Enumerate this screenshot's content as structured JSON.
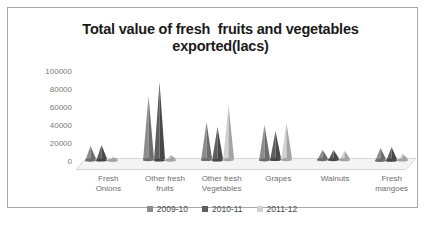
{
  "chart_data": {
    "type": "bar",
    "title": "Total value of fresh  fruits and vegetables exported(lacs)",
    "xlabel": "",
    "ylabel": "",
    "ylim": [
      0,
      100000
    ],
    "yticks": [
      "0",
      "20000",
      "40000",
      "60000",
      "80000",
      "100000"
    ],
    "ytick_values": [
      0,
      20000,
      40000,
      60000,
      80000,
      100000
    ],
    "grid": false,
    "legend_position": "bottom",
    "categories": [
      "Fresh\nOnions",
      "Other fresh\nfruits",
      "Other fresh\nVegetables",
      "Grapes",
      "Walnuts",
      "Fresh\nmangoes"
    ],
    "series": [
      {
        "name": "2009-10",
        "color": "#8c8c8c",
        "values": [
          17000,
          72000,
          43000,
          40000,
          12000,
          15000
        ]
      },
      {
        "name": "2010-11",
        "color": "#5e5e5e",
        "values": [
          18000,
          88000,
          38000,
          33000,
          12000,
          16000
        ]
      },
      {
        "name": "2011-12",
        "color": "#d2d2d2",
        "values": [
          5000,
          7000,
          62000,
          42000,
          11000,
          8000
        ]
      }
    ]
  },
  "colors": {
    "frame": "#a8a8a8",
    "title": "#1a1a1a",
    "axis_text": "#7a7a7a",
    "floor": "#efefef",
    "background": "#ffffff"
  }
}
